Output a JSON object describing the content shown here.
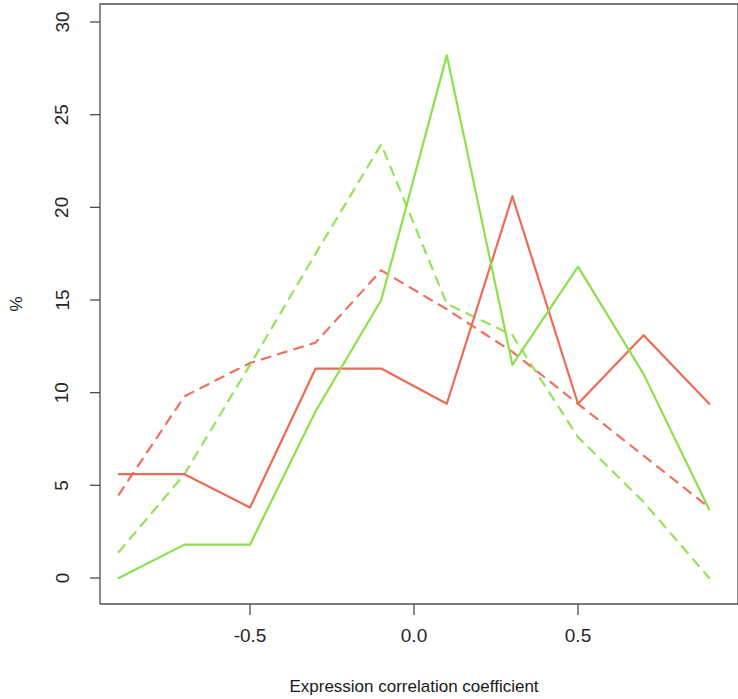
{
  "chart_data": {
    "type": "line",
    "title": "",
    "subtitle": "",
    "xlabel": "Expression correlation coefficient",
    "ylabel": "%",
    "xlim": [
      -1.0,
      0.9
    ],
    "ylim": [
      0,
      31.5
    ],
    "grid": false,
    "legend_position": "none",
    "x": [
      -0.9,
      -0.7,
      -0.5,
      -0.3,
      -0.1,
      0.1,
      0.3,
      0.5,
      0.7,
      0.9
    ],
    "x_tick_labels": [
      "-0.5",
      "0.0",
      "0.5"
    ],
    "x_tick_values": [
      -0.5,
      0.0,
      0.5
    ],
    "y_tick_labels": [
      "0",
      "5",
      "10",
      "15",
      "20",
      "25",
      "30"
    ],
    "y_tick_values": [
      0,
      5,
      10,
      15,
      20,
      25,
      30
    ],
    "series": [
      {
        "name": "red-solid",
        "style": "solid",
        "color": "#EE6A52",
        "values": [
          5.6,
          5.6,
          3.8,
          11.3,
          11.3,
          9.4,
          20.6,
          9.4,
          13.1,
          9.4
        ]
      },
      {
        "name": "green-solid",
        "style": "solid",
        "color": "#8CE04B",
        "values": [
          0.0,
          1.8,
          1.8,
          9.0,
          15.0,
          28.2,
          11.5,
          16.8,
          11.0,
          3.7
        ]
      },
      {
        "name": "red-dashed",
        "style": "dashed",
        "color": "#F0705E",
        "values": [
          4.5,
          9.8,
          11.6,
          12.7,
          16.6,
          14.5,
          12.2,
          9.4,
          6.6,
          3.8
        ]
      },
      {
        "name": "green-dashed",
        "style": "dashed",
        "color": "#96E25A",
        "values": [
          1.4,
          5.6,
          11.5,
          17.5,
          23.4,
          14.8,
          13.1,
          7.6,
          4.1,
          0.0
        ]
      }
    ]
  },
  "axes": {
    "x_title": "Expression correlation coefficient",
    "y_title": "%"
  },
  "colors": {
    "axis": "#4d4d4d",
    "text": "#262626",
    "background": "#ffffff"
  }
}
